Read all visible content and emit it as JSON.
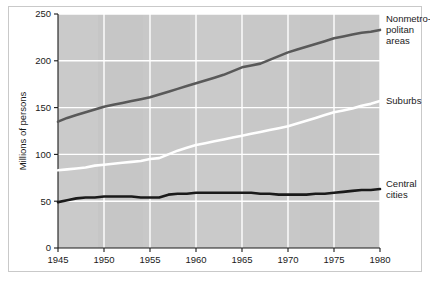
{
  "chart_data": {
    "type": "line",
    "title": "",
    "subtitle": "",
    "xlabel": "",
    "ylabel": "Millions of persons",
    "xlim": [
      1945,
      1980
    ],
    "ylim": [
      0,
      250
    ],
    "grid": true,
    "legend_position": "right-inline-annotations",
    "x_ticks": [
      "1945",
      "1950",
      "1955",
      "1960",
      "1965",
      "1970",
      "1975",
      "1980"
    ],
    "x_tick_values": [
      1945,
      1950,
      1955,
      1960,
      1965,
      1970,
      1975,
      1980
    ],
    "y_ticks": [
      "0",
      "50",
      "100",
      "150",
      "200",
      "250"
    ],
    "y_tick_values": [
      0,
      50,
      100,
      150,
      200,
      250
    ],
    "x": [
      1945,
      1946,
      1947,
      1948,
      1949,
      1950,
      1951,
      1952,
      1953,
      1954,
      1955,
      1956,
      1957,
      1958,
      1959,
      1960,
      1961,
      1962,
      1963,
      1964,
      1965,
      1966,
      1967,
      1968,
      1969,
      1970,
      1971,
      1972,
      1973,
      1974,
      1975,
      1976,
      1977,
      1978,
      1979,
      1980
    ],
    "series": [
      {
        "name": "Nonmetropolitan areas",
        "color": "#595959",
        "values": [
          135,
          139,
          142,
          145,
          148,
          151,
          153,
          155,
          157,
          159,
          161,
          164,
          167,
          170,
          173,
          176,
          179,
          182,
          185,
          189,
          193,
          195,
          197,
          201,
          205,
          209,
          212,
          215,
          218,
          221,
          224,
          226,
          228,
          230,
          231,
          233
        ]
      },
      {
        "name": "Suburbs",
        "color": "#ffffff",
        "values": [
          83,
          84,
          85,
          86,
          88,
          89,
          90,
          91,
          92,
          93,
          95,
          96,
          100,
          104,
          107,
          110,
          112,
          114,
          116,
          118,
          120,
          122,
          124,
          126,
          128,
          130,
          133,
          136,
          139,
          142,
          145,
          147,
          149,
          152,
          154,
          157
        ]
      },
      {
        "name": "Central cities",
        "color": "#1a1a1a",
        "values": [
          49,
          51,
          53,
          54,
          54,
          55,
          55,
          55,
          55,
          54,
          54,
          54,
          57,
          58,
          58,
          59,
          59,
          59,
          59,
          59,
          59,
          59,
          58,
          58,
          57,
          57,
          57,
          57,
          58,
          58,
          59,
          60,
          61,
          62,
          62,
          63
        ]
      }
    ],
    "annotations": [
      {
        "id": "nonmetro",
        "lines": [
          "Nonmetro-",
          "politan",
          "areas"
        ],
        "x": 1980,
        "y": 233
      },
      {
        "id": "suburbs",
        "lines": [
          "Suburbs"
        ],
        "x": 1980,
        "y": 157
      },
      {
        "id": "central",
        "lines": [
          "Central",
          "cities"
        ],
        "x": 1980,
        "y": 63
      }
    ],
    "plot_background_color": "#c8c8c8",
    "gridline_color": "#ffffff",
    "axis_color": "#1a1a1a",
    "frame_border_color": "#c9c9c9"
  }
}
